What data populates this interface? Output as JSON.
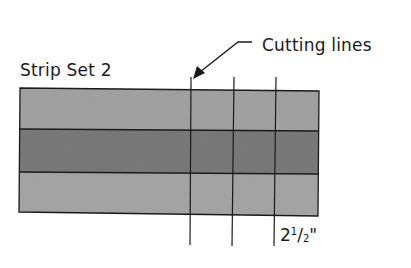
{
  "diagram": {
    "title": "Strip Set 2",
    "callout_label": "Cutting lines",
    "measurement": {
      "whole": "2",
      "numerator": "1",
      "slash": "/",
      "denominator": "2",
      "unit": "\""
    },
    "strips": [
      {
        "name": "top-strip",
        "shade": "light",
        "color": "#a3a3a3"
      },
      {
        "name": "middle-strip",
        "shade": "dark",
        "color": "#7a7a7a"
      },
      {
        "name": "bottom-strip",
        "shade": "light",
        "color": "#a6a6a6"
      }
    ],
    "cutting_line_count": 3,
    "colors": {
      "outline": "#1a1a1a",
      "text": "#1a1a1a",
      "background": "#ffffff"
    }
  }
}
